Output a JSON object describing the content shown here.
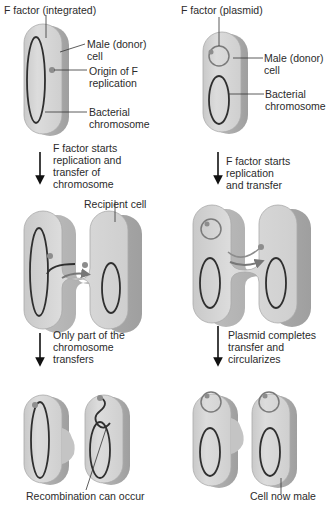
{
  "colors": {
    "cell_fill": "#d3d3d3",
    "cell_side": "#b8b8b8",
    "cell_edge": "#9e9e9e",
    "chromosome": "#2f2f2f",
    "origin_dot": "#8d8d8d",
    "arrow": "#111111",
    "text": "#2b2b2b"
  },
  "left_column": {
    "heading": "F factor (integrated)",
    "labels": {
      "male_cell_1": "Male (donor)",
      "male_cell_2": "cell",
      "origin_1": "Origin of F",
      "origin_2": "replication",
      "chromosome_1": "Bacterial",
      "chromosome_2": "chromosome",
      "recipient": "Recipient cell",
      "recombination": "Recombination can occur"
    },
    "steps": [
      {
        "lines": [
          "F factor starts",
          "replication and",
          "transfer of",
          "chromosome"
        ]
      },
      {
        "lines": [
          "Only part of the",
          "chromosome",
          "transfers"
        ]
      }
    ]
  },
  "right_column": {
    "heading": "F factor (plasmid)",
    "labels": {
      "male_cell_1": "Male (donor)",
      "male_cell_2": "cell",
      "chromosome_1": "Bacterial",
      "chromosome_2": "chromosome",
      "now_male": "Cell now male"
    },
    "steps": [
      {
        "lines": [
          "F factor starts",
          "replication",
          "and transfer"
        ]
      },
      {
        "lines": [
          "Plasmid completes",
          "transfer and",
          "circularizes"
        ]
      }
    ]
  }
}
